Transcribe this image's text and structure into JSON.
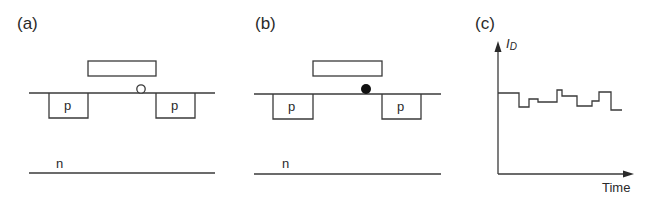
{
  "panels": [
    {
      "id": "a",
      "label": "(a)",
      "regions": {
        "source": "p",
        "drain": "p",
        "substrate": "n"
      },
      "trap_state": "empty",
      "trap_marker": "open-circle"
    },
    {
      "id": "b",
      "label": "(b)",
      "regions": {
        "source": "p",
        "drain": "p",
        "substrate": "n"
      },
      "trap_state": "filled",
      "trap_marker": "filled-circle"
    },
    {
      "id": "c",
      "label": "(c)",
      "y_axis_label": "I",
      "y_axis_subscript": "D",
      "x_axis_label": "Time"
    }
  ],
  "colors": {
    "stroke": "#3a3a3a",
    "text": "#2a2a2a",
    "filled_trap": "#111111",
    "background": "#ffffff"
  },
  "chart_data": {
    "type": "line",
    "title": "",
    "xlabel": "Time",
    "ylabel": "I_D",
    "step_points_px": [
      [
        498,
        93
      ],
      [
        519,
        93
      ],
      [
        519,
        107
      ],
      [
        529,
        107
      ],
      [
        529,
        99
      ],
      [
        538,
        99
      ],
      [
        538,
        102
      ],
      [
        557,
        102
      ],
      [
        557,
        90
      ],
      [
        562,
        90
      ],
      [
        562,
        96
      ],
      [
        577,
        96
      ],
      [
        577,
        106
      ],
      [
        592,
        106
      ],
      [
        592,
        101
      ],
      [
        599,
        101
      ],
      [
        599,
        92
      ],
      [
        611,
        92
      ],
      [
        611,
        110
      ],
      [
        622,
        110
      ]
    ],
    "grid": false,
    "legend": "none"
  }
}
